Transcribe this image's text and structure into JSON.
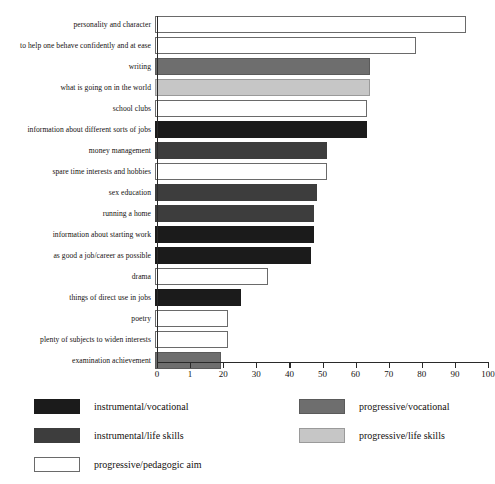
{
  "chart_data": {
    "type": "bar",
    "orientation": "horizontal",
    "title": "",
    "xlabel": "",
    "ylabel": "",
    "xlim": [
      0,
      100
    ],
    "grid": false,
    "axis_ticks": [
      "0",
      "1",
      "20",
      "30",
      "40",
      "50",
      "60",
      "70",
      "80",
      "90",
      "100"
    ],
    "axis_tick_values": [
      0,
      10,
      20,
      30,
      40,
      50,
      60,
      70,
      80,
      90,
      100
    ],
    "legend_position": "below",
    "categories": [
      "personality and character",
      "to help one behave confidently and at ease",
      "writing",
      "what is going on in the world",
      "school clubs",
      "information about different sorts of jobs",
      "money management",
      "spare time interests and hobbies",
      "sex education",
      "running a home",
      "information about starting work",
      "as good a job/career as possible",
      "drama",
      "things of direct use in jobs",
      "poetry",
      "plenty of subjects to widen interests",
      "examination achievement"
    ],
    "values": [
      94,
      79,
      65,
      65,
      64,
      64,
      52,
      52,
      49,
      48,
      48,
      47,
      34,
      26,
      22,
      22,
      20
    ],
    "bar_groups": [
      "progressive/pedagogic aim",
      "progressive/pedagogic aim",
      "progressive/vocational",
      "progressive/life skills",
      "progressive/pedagogic aim",
      "instrumental/vocational",
      "instrumental/life skills",
      "progressive/pedagogic aim",
      "instrumental/life skills",
      "instrumental/life skills",
      "instrumental/vocational",
      "instrumental/vocational",
      "progressive/pedagogic aim",
      "instrumental/vocational",
      "progressive/pedagogic aim",
      "progressive/pedagogic aim",
      "progressive/vocational"
    ],
    "legend": [
      {
        "label": "instrumental/vocational",
        "key": "c-iv",
        "color": "#1b1b1b",
        "column": "left"
      },
      {
        "label": "instrumental/life skills",
        "key": "c-ils",
        "color": "#3d3d3d",
        "column": "left"
      },
      {
        "label": "progressive/pedagogic aim",
        "key": "c-ppa",
        "color": "#ffffff",
        "column": "left"
      },
      {
        "label": "progressive/vocational",
        "key": "c-pv",
        "color": "#6e6e6e",
        "column": "right"
      },
      {
        "label": "progressive/life skills",
        "key": "c-pls",
        "color": "#c6c6c6",
        "column": "right"
      }
    ]
  },
  "caption": ""
}
